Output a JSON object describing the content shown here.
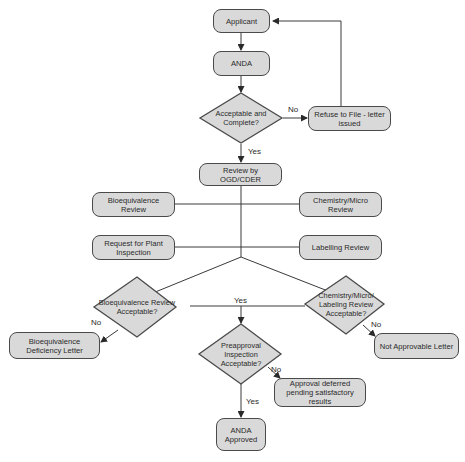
{
  "diagram": {
    "type": "flowchart",
    "nodes": {
      "applicant": "Applicant",
      "anda": "ANDA",
      "acceptable_complete": "Acceptable and Complete?",
      "refuse_to_file": "Refuse to File - letter issued",
      "review_ogd": "Review by OGD/CDER",
      "bioequivalence_review": "Bioequivalence Review",
      "chemistry_micro_review": "Chemistry/Micro Review",
      "plant_inspection_request": "Request for Plant Inspection",
      "labelling_review": "Labelling Review",
      "bioequivalence_acceptable": "Bioequivalence Review Acceptable?",
      "chemistry_labeling_acceptable": "Chemistry/Micro/ Labeling Review Acceptable?",
      "bioequivalence_deficiency": "Bioequivalence Deficiency Letter",
      "not_approvable": "Not Approvable Letter",
      "preapproval_inspection": "Preapproval Inspection Acceptable?",
      "approval_deferred": "Approval deferred pending satisfactory results",
      "anda_approved": "ANDA Approved"
    },
    "edge_labels": {
      "no_refuse": "No",
      "yes_review": "Yes",
      "yes_both": "Yes",
      "no_bio": "No",
      "no_chem": "No",
      "no_preapproval": "No",
      "yes_approved": "Yes"
    },
    "edges": [
      {
        "from": "applicant",
        "to": "anda",
        "label": ""
      },
      {
        "from": "anda",
        "to": "acceptable_complete",
        "label": ""
      },
      {
        "from": "acceptable_complete",
        "to": "refuse_to_file",
        "label": "No"
      },
      {
        "from": "refuse_to_file",
        "to": "applicant",
        "label": ""
      },
      {
        "from": "acceptable_complete",
        "to": "review_ogd",
        "label": "Yes"
      },
      {
        "from": "review_ogd",
        "to": "bioequivalence_review",
        "label": ""
      },
      {
        "from": "review_ogd",
        "to": "chemistry_micro_review",
        "label": ""
      },
      {
        "from": "review_ogd",
        "to": "plant_inspection_request",
        "label": ""
      },
      {
        "from": "review_ogd",
        "to": "labelling_review",
        "label": ""
      },
      {
        "from": "review_ogd",
        "to": "bioequivalence_acceptable",
        "label": ""
      },
      {
        "from": "review_ogd",
        "to": "chemistry_labeling_acceptable",
        "label": ""
      },
      {
        "from": "bioequivalence_acceptable",
        "to": "bioequivalence_deficiency",
        "label": "No"
      },
      {
        "from": "chemistry_labeling_acceptable",
        "to": "not_approvable",
        "label": "No"
      },
      {
        "from": "bioequivalence_acceptable",
        "to": "preapproval_inspection",
        "label": "Yes"
      },
      {
        "from": "chemistry_labeling_acceptable",
        "to": "preapproval_inspection",
        "label": "Yes"
      },
      {
        "from": "preapproval_inspection",
        "to": "approval_deferred",
        "label": "No"
      },
      {
        "from": "preapproval_inspection",
        "to": "anda_approved",
        "label": "Yes"
      }
    ]
  },
  "colors": {
    "node_fill": "#d9d9d9",
    "node_stroke": "#4a4a4a",
    "line": "#3a3a3a",
    "text": "#2a2a2a",
    "background": "#ffffff"
  }
}
